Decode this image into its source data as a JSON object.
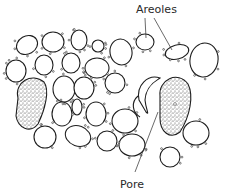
{
  "diagram": {
    "labels": {
      "areoles": "Areoles",
      "pore": "Pore"
    },
    "colors": {
      "line": "#1e1e1e",
      "background": "#ffffff",
      "stipple": "#333333"
    },
    "cells": [
      {
        "cx": 27,
        "cy": 45,
        "rx": 11,
        "ry": 9,
        "rot": -30
      },
      {
        "cx": 53,
        "cy": 42,
        "rx": 11,
        "ry": 10,
        "rot": 0
      },
      {
        "cx": 79,
        "cy": 40,
        "rx": 8,
        "ry": 10,
        "rot": 0
      },
      {
        "cx": 98,
        "cy": 46,
        "rx": 6,
        "ry": 6,
        "rot": 0
      },
      {
        "cx": 121,
        "cy": 52,
        "rx": 11,
        "ry": 13,
        "rot": -10
      },
      {
        "cx": 145,
        "cy": 42,
        "rx": 9,
        "ry": 8,
        "rot": 0
      },
      {
        "cx": 177,
        "cy": 52,
        "rx": 12,
        "ry": 7,
        "rot": -15
      },
      {
        "cx": 204,
        "cy": 60,
        "rx": 14,
        "ry": 17,
        "rot": 10
      },
      {
        "cx": 16,
        "cy": 71,
        "rx": 10,
        "ry": 11,
        "rot": 0
      },
      {
        "cx": 44,
        "cy": 65,
        "rx": 9,
        "ry": 10,
        "rot": 0
      },
      {
        "cx": 71,
        "cy": 63,
        "rx": 9,
        "ry": 10,
        "rot": 0
      },
      {
        "cx": 97,
        "cy": 68,
        "rx": 12,
        "ry": 10,
        "rot": 0
      },
      {
        "cx": 64,
        "cy": 89,
        "rx": 11,
        "ry": 13,
        "rot": 0
      },
      {
        "cx": 84,
        "cy": 88,
        "rx": 10,
        "ry": 11,
        "rot": 0
      },
      {
        "cx": 115,
        "cy": 83,
        "rx": 10,
        "ry": 10,
        "rot": 0
      },
      {
        "cx": 62,
        "cy": 114,
        "rx": 10,
        "ry": 12,
        "rot": 0
      },
      {
        "cx": 77,
        "cy": 107,
        "rx": 5,
        "ry": 8,
        "rot": 0
      },
      {
        "cx": 96,
        "cy": 114,
        "rx": 10,
        "ry": 12,
        "rot": 0
      },
      {
        "cx": 125,
        "cy": 121,
        "rx": 13,
        "ry": 12,
        "rot": 0
      },
      {
        "cx": 45,
        "cy": 137,
        "rx": 11,
        "ry": 11,
        "rot": 0
      },
      {
        "cx": 78,
        "cy": 136,
        "rx": 13,
        "ry": 10,
        "rot": 20
      },
      {
        "cx": 107,
        "cy": 141,
        "rx": 10,
        "ry": 10,
        "rot": 0
      },
      {
        "cx": 132,
        "cy": 145,
        "rx": 13,
        "ry": 11,
        "rot": 0
      },
      {
        "cx": 196,
        "cy": 133,
        "rx": 13,
        "ry": 12,
        "rot": 0
      },
      {
        "cx": 170,
        "cy": 157,
        "rx": 10,
        "ry": 10,
        "rot": 0
      }
    ]
  }
}
